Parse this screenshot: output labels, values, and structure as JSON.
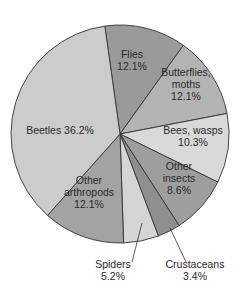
{
  "chart_data": {
    "type": "pie",
    "title": "",
    "start_angle_deg": -8,
    "direction": "clockwise",
    "slices": [
      {
        "label": "Flies",
        "value": 12.1,
        "color": "#9a9a9a",
        "text": [
          "Flies",
          "12.1%"
        ],
        "label_pos": [
          132,
          60
        ]
      },
      {
        "label": "Butterflies, moths",
        "value": 12.1,
        "color": "#b3b3b3",
        "text": [
          "Butterflies,",
          "moths",
          "12.1%"
        ],
        "label_pos": [
          186,
          84
        ]
      },
      {
        "label": "Bees, wasps",
        "value": 10.3,
        "color": "#d9d9d9",
        "text": [
          "Bees, wasps",
          "10.3%"
        ],
        "label_pos": [
          193,
          136
        ]
      },
      {
        "label": "Other insects",
        "value": 8.6,
        "color": "#9e9e9e",
        "text": [
          "Other",
          "insects",
          "8.6%"
        ],
        "label_pos": [
          179,
          178
        ]
      },
      {
        "label": "Crustaceans",
        "value": 3.4,
        "color": "#8f8f8f",
        "text": [
          "Crustaceans",
          "3.4%"
        ],
        "label_pos": [
          195,
          270
        ],
        "callout": [
          [
            170,
            228
          ],
          [
            186,
            262
          ]
        ]
      },
      {
        "label": "Spiders",
        "value": 5.2,
        "color": "#d5d5d5",
        "text": [
          "Spiders",
          "5.2%"
        ],
        "label_pos": [
          113,
          270
        ],
        "callout": [
          [
            142,
            223
          ],
          [
            132,
            262
          ]
        ]
      },
      {
        "label": "Other arthropods",
        "value": 12.1,
        "color": "#a3a3a3",
        "text": [
          "Other",
          "arthropods",
          "12.1%"
        ],
        "label_pos": [
          89,
          192
        ]
      },
      {
        "label": "Beetles",
        "value": 36.2,
        "color": "#cccccc",
        "text": [
          "Beetles 36.2%"
        ],
        "label_pos": [
          60,
          130
        ]
      }
    ],
    "legend": "none"
  }
}
